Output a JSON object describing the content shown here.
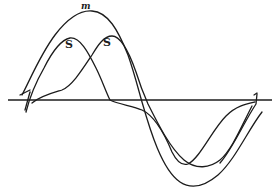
{
  "figure": {
    "ink_color": "#1c1c1c",
    "background_color": "#ffffff",
    "labels": {
      "resultant": "m",
      "component_1": "S",
      "component_2": "S"
    },
    "curves": [
      {
        "name": "resultant-m",
        "peak": [
          90,
          10
        ],
        "trough": [
          188,
          185
        ]
      },
      {
        "name": "component-s1",
        "peak": [
          70,
          38
        ],
        "trough": [
          178,
          165
        ]
      },
      {
        "name": "component-s2",
        "peak": [
          110,
          36
        ],
        "trough": [
          218,
          165
        ]
      }
    ],
    "baseline": {
      "y": 100,
      "x_start": 8,
      "x_end": 272
    }
  }
}
